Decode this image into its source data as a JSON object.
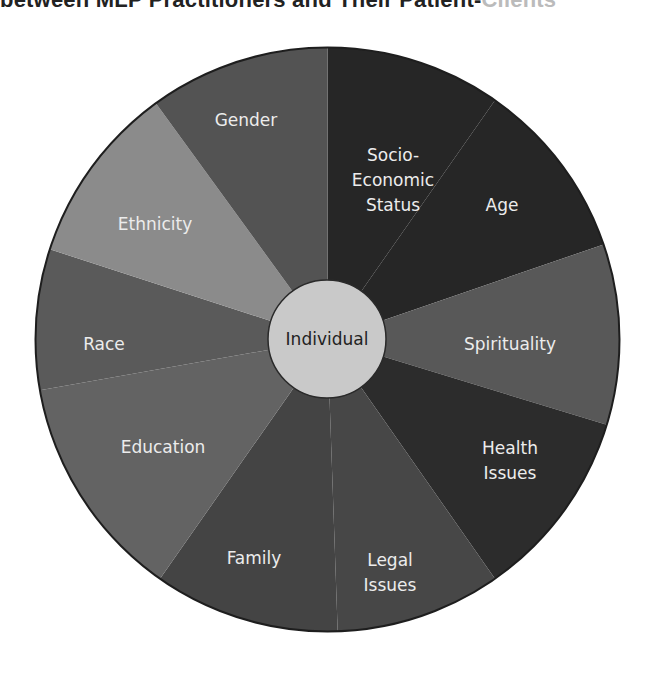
{
  "title": {
    "text": "between MLP Practitioners and Their Patient-Clients",
    "visible_part": "between MLP Practitioners and Their Patient-",
    "faded_part": "Clients"
  },
  "diagram": {
    "center_label": "Individual",
    "center_color": "#c9c9c9",
    "segments": [
      {
        "label": "Socio-Economic Status",
        "lines": [
          "Socio-",
          "Economic",
          "Status"
        ],
        "color": "#262626"
      },
      {
        "label": "Age",
        "lines": [
          "Age"
        ],
        "color": "#262626"
      },
      {
        "label": "Spirituality",
        "lines": [
          "Spirituality"
        ],
        "color": "#585858"
      },
      {
        "label": "Health Issues",
        "lines": [
          "Health",
          "Issues"
        ],
        "color": "#2c2c2c"
      },
      {
        "label": "Legal Issues",
        "lines": [
          "Legal",
          "Issues"
        ],
        "color": "#474747"
      },
      {
        "label": "Family",
        "lines": [
          "Family"
        ],
        "color": "#444444"
      },
      {
        "label": "Education",
        "lines": [
          "Education"
        ],
        "color": "#636363"
      },
      {
        "label": "Race",
        "lines": [
          "Race"
        ],
        "color": "#5a5a5a"
      },
      {
        "label": "Ethnicity",
        "lines": [
          "Ethnicity"
        ],
        "color": "#8b8b8b"
      },
      {
        "label": "Gender",
        "lines": [
          "Gender"
        ],
        "color": "#535353"
      }
    ]
  }
}
